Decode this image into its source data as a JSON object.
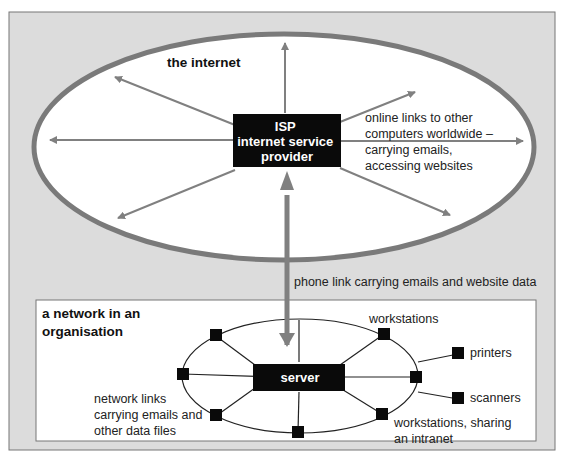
{
  "colors": {
    "frame_bg": "#dcdcdc",
    "frame_border": "#777777",
    "ellipse_stroke": "#7a7a7a",
    "arrow": "#808080",
    "box": "#0a0a0a",
    "box_text": "#ffffff",
    "text": "#222222",
    "panel_bg": "#ffffff"
  },
  "internet": {
    "title": "the internet",
    "isp_box": {
      "lines": [
        "ISP",
        "internet service",
        "provider"
      ]
    },
    "links_label": [
      "online links to other",
      "computers worldwide –",
      "carrying emails,",
      "accessing websites"
    ]
  },
  "phone_link": {
    "label": "phone link carrying emails and website data"
  },
  "organisation": {
    "title": [
      "a network in an",
      "organisation"
    ],
    "server_label": "server",
    "labels": {
      "workstations_top": "workstations",
      "printers": "printers",
      "scanners": "scanners",
      "workstations_bottom": [
        "workstations, sharing",
        "an intranet"
      ],
      "network_links": [
        "network links",
        "carrying emails and",
        "other data files"
      ]
    }
  }
}
